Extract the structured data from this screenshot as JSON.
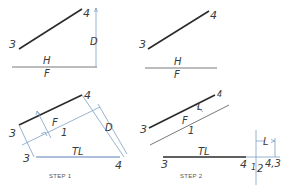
{
  "diagram": {
    "type": "descriptive-geometry-true-length-construction",
    "colors": {
      "line": "#2b2b2b",
      "projector": "#7f9fc4",
      "true_length": "#5c82b8",
      "text": "#3a3a3a"
    },
    "panel_top_left": {
      "point_labels": {
        "p3": "3",
        "p4": "4"
      },
      "dimension_label": "D",
      "fold_line_above": "H",
      "fold_line_below": "F"
    },
    "panel_top_right": {
      "point_labels": {
        "p3": "3",
        "p4": "4"
      },
      "fold_line_above": "H",
      "fold_line_below": "F"
    },
    "panel_step1": {
      "caption": "STEP 1",
      "point_labels": {
        "p3_top": "3",
        "p4_top": "4",
        "p3_bottom": "3",
        "p4_bottom": "4"
      },
      "fold_line_a": "F",
      "fold_line_b": "1",
      "dimension_label": "D",
      "true_length_label": "TL"
    },
    "panel_step2": {
      "caption": "STEP 2",
      "point_labels": {
        "p3_top": "3",
        "p4_top": "4",
        "p3_bottom": "3",
        "p4_bottom": "4",
        "point_view": "4,3"
      },
      "fold_line_a": "F",
      "fold_line_b": "1",
      "fold_line_c": "1",
      "fold_line_d": "2",
      "dimension_label_top": "L",
      "dimension_label_right": "L",
      "true_length_label": "TL"
    }
  }
}
